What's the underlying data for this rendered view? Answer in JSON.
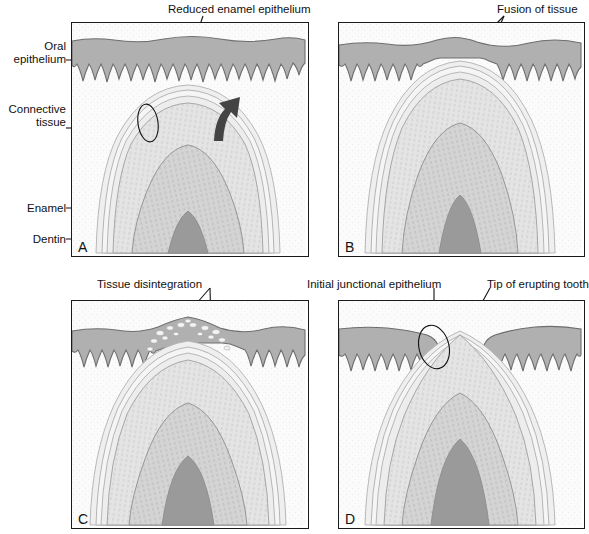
{
  "figure": {
    "type": "four-panel anatomical illustration",
    "panels": [
      {
        "id": "A",
        "letter": "A",
        "caption": "Reduced enamel epithelium approaches oral epithelium; enzymes released",
        "callouts": [
          "Reduced enamel epithelium",
          "Enzymes"
        ]
      },
      {
        "id": "B",
        "letter": "B",
        "caption": "Reduced enamel epithelium fuses with oral epithelium",
        "callouts": [
          "Fusion of tissue"
        ]
      },
      {
        "id": "C",
        "letter": "C",
        "caption": "Fused tissue disintegrates over the crown tip",
        "callouts": [
          "Tissue disintegration"
        ]
      },
      {
        "id": "D",
        "letter": "D",
        "caption": "Tooth tip emerges; initial junctional epithelium forms",
        "callouts": [
          "Initial junctional epithelium",
          "Tip of erupting tooth"
        ]
      }
    ]
  },
  "side_labels": [
    {
      "name": "oral-epithelium",
      "text": "Oral\nepithelium"
    },
    {
      "name": "connective-tissue",
      "text": "Connective\ntissue"
    },
    {
      "name": "enamel",
      "text": "Enamel"
    },
    {
      "name": "dentin",
      "text": "Dentin"
    }
  ],
  "callout_labels": {
    "reduced_enamel_epithelium": "Reduced enamel epithelium",
    "enzymes": "Enzymes",
    "fusion_of_tissue": "Fusion of tissue",
    "tissue_disintegration": "Tissue disintegration",
    "initial_junctional_epithelium": "Initial junctional epithelium",
    "tip_of_erupting_tooth": "Tip of erupting tooth"
  },
  "panel_letters": {
    "a": "A",
    "b": "B",
    "c": "C",
    "d": "D"
  },
  "colors": {
    "border": "#1a1a1a",
    "oral_epithelium": "#b0b0b0",
    "epithelium_outline": "#6e6e6e",
    "connective_tissue": "#fbfbfb",
    "enamel": "#e3e3e3",
    "dentin": "#cfcfcf",
    "pulp": "#9a9a9a",
    "reduced_enamel_epithelium": "#f2f2f2",
    "text": "#111111"
  }
}
